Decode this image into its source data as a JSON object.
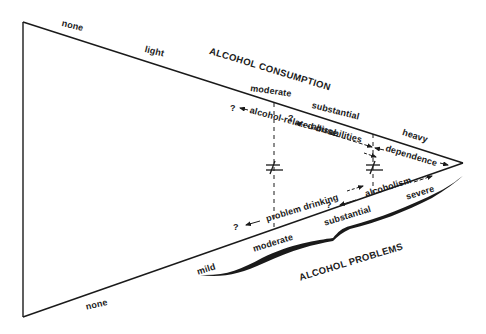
{
  "diagram": {
    "consumption": {
      "title": "ALCOHOL CONSUMPTION",
      "levels": [
        "none",
        "light",
        "moderate",
        "substantial",
        "heavy"
      ]
    },
    "problems": {
      "title": "ALCOHOL PROBLEMS",
      "levels": [
        "none",
        "mild",
        "moderate",
        "substantial",
        "severe"
      ]
    },
    "terms": {
      "abuse": "abuse",
      "disabilities": "alcohol-related disabilities",
      "dependence": "dependence",
      "problem_drinking": "problem drinking",
      "alcoholism": "alcoholism",
      "unknown": "?"
    },
    "marks": {
      "not_equal": "≠"
    },
    "colors": {
      "ink": "#1a1a1a",
      "background": "#ffffff"
    }
  }
}
